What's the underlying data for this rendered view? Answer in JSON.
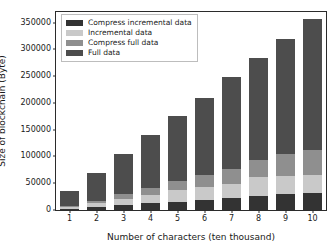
{
  "chart_data": {
    "type": "bar",
    "stacked": true,
    "title": "",
    "xlabel": "Number of characters (ten thousand)",
    "ylabel": "Size of blockchain (Byte)",
    "categories": [
      "1",
      "2",
      "3",
      "4",
      "5",
      "6",
      "7",
      "8",
      "9",
      "10"
    ],
    "ylim": [
      0,
      370000
    ],
    "yticks": [
      0,
      50000,
      100000,
      150000,
      200000,
      250000,
      300000,
      350000
    ],
    "ytick_labels": [
      "0",
      "50000",
      "100000",
      "150000",
      "200000",
      "250000",
      "300000",
      "350000"
    ],
    "grid": false,
    "legend_position": "upper left",
    "series": [
      {
        "name": "Compress incremental data",
        "color": "#333333",
        "values": [
          2500,
          6000,
          9500,
          12500,
          15500,
          19000,
          23000,
          25500,
          29000,
          31500
        ]
      },
      {
        "name": "Incremental data",
        "color": "#c9c9c9",
        "values": [
          3000,
          6500,
          11000,
          15500,
          22000,
          23500,
          26000,
          35500,
          35000,
          33000
        ]
      },
      {
        "name": "Compress full data",
        "color": "#8f8f8f",
        "values": [
          2500,
          5000,
          8500,
          13500,
          16000,
          23500,
          27000,
          32000,
          40000,
          48000
        ]
      },
      {
        "name": "Full data",
        "color": "#4d4d4d",
        "values": [
          28000,
          52500,
          76000,
          98500,
          121500,
          144000,
          172000,
          191000,
          216000,
          244500
        ]
      }
    ],
    "totals": [
      36000,
      70000,
      105000,
      140000,
      175000,
      210000,
      248000,
      284000,
      320000,
      357000
    ]
  },
  "legend": {
    "items": [
      {
        "label": "Compress incremental data"
      },
      {
        "label": "Incremental data"
      },
      {
        "label": "Compress full data"
      },
      {
        "label": "Full data"
      }
    ]
  }
}
